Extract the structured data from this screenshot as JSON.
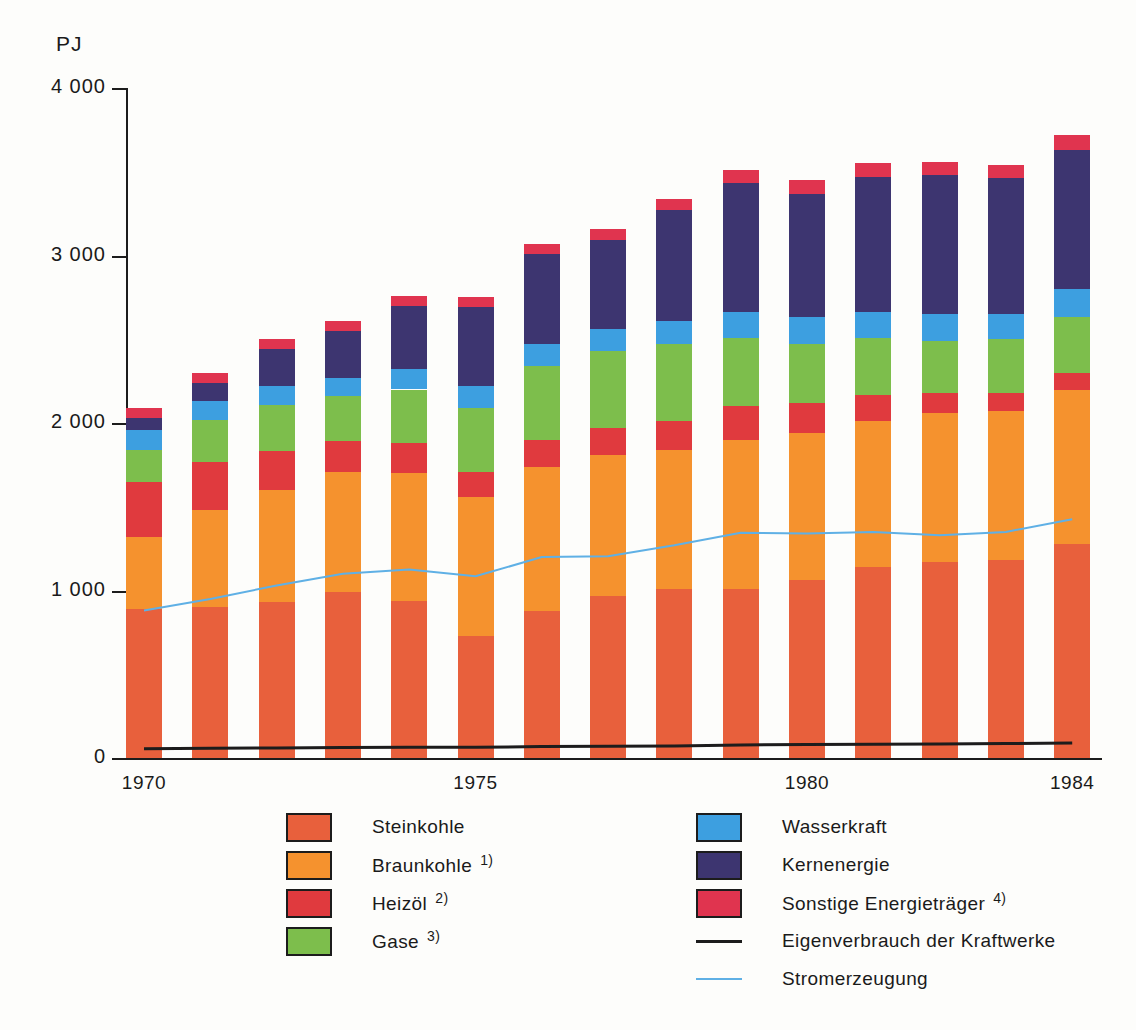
{
  "chart_data": {
    "type": "bar",
    "stacked": true,
    "title": "",
    "subtitle": "",
    "xlabel": "",
    "ylabel": "PJ",
    "unit": "PJ",
    "ylim": [
      0,
      4000
    ],
    "yticks": [
      "0",
      "1 000",
      "2 000",
      "3 000",
      "4 000"
    ],
    "ytick_values": [
      0,
      1000,
      2000,
      3000,
      4000
    ],
    "xticks_shown": [
      "1970",
      "1975",
      "1980",
      "1984"
    ],
    "grid": false,
    "legend_position": "below",
    "categories": [
      "1970",
      "1971",
      "1972",
      "1973",
      "1974",
      "1975",
      "1976",
      "1977",
      "1978",
      "1979",
      "1980",
      "1981",
      "1982",
      "1983",
      "1984"
    ],
    "series": [
      {
        "name": "Steinkohle",
        "color": "#e8603c",
        "values": [
          890,
          900,
          930,
          990,
          940,
          730,
          880,
          970,
          1010,
          1010,
          1060,
          1140,
          1170,
          1180,
          1280
        ]
      },
      {
        "name": "Braunkohle",
        "footnote": "1)",
        "color": "#f5922e",
        "values": [
          430,
          580,
          670,
          720,
          760,
          830,
          860,
          840,
          830,
          890,
          880,
          870,
          890,
          890,
          920
        ]
      },
      {
        "name": "Heizöl",
        "footnote": "2)",
        "color": "#e03a3e",
        "values": [
          330,
          290,
          230,
          180,
          180,
          150,
          160,
          160,
          170,
          200,
          180,
          160,
          120,
          110,
          100
        ]
      },
      {
        "name": "Gase",
        "footnote": "3)",
        "color": "#7dbe4c",
        "values": [
          190,
          250,
          280,
          270,
          320,
          380,
          440,
          460,
          460,
          410,
          350,
          340,
          310,
          320,
          330
        ]
      },
      {
        "name": "Wasserkraft",
        "color": "#3d9fe0",
        "values": [
          120,
          110,
          110,
          110,
          120,
          130,
          130,
          130,
          140,
          150,
          160,
          150,
          160,
          150,
          170
        ]
      },
      {
        "name": "Kernenergie",
        "color": "#3d3570",
        "values": [
          70,
          110,
          220,
          280,
          380,
          470,
          540,
          530,
          660,
          770,
          740,
          810,
          830,
          810,
          830
        ]
      },
      {
        "name": "Sonstige Energieträger",
        "footnote": "4)",
        "color": "#e0344f",
        "values": [
          60,
          60,
          60,
          60,
          60,
          60,
          60,
          70,
          70,
          80,
          80,
          80,
          80,
          80,
          90
        ]
      }
    ],
    "lines": [
      {
        "name": "Eigenverbrauch der Kraftwerke",
        "color": "#1c1c1c",
        "style": "solid",
        "width": 3,
        "values": [
          55,
          58,
          60,
          62,
          64,
          64,
          68,
          70,
          72,
          78,
          80,
          82,
          84,
          86,
          90
        ]
      },
      {
        "name": "Stromerzeugung",
        "color": "#5fb0e5",
        "style": "solid",
        "width": 2,
        "values": [
          880,
          950,
          1030,
          1100,
          1125,
          1085,
          1200,
          1205,
          1270,
          1345,
          1340,
          1350,
          1330,
          1350,
          1425
        ]
      }
    ],
    "totals": [
      2410,
      2530,
      2690,
      2900,
      3000,
      2900,
      3160,
      3160,
      3320,
      3500,
      3490,
      3470,
      3450,
      3500,
      3760
    ]
  },
  "axes": {
    "unit_label": "PJ",
    "y_tick_labels": [
      "4 000",
      "3 000",
      "2 000",
      "1 000",
      "0"
    ],
    "x_tick_labels": [
      "1970",
      "1975",
      "1980",
      "1984"
    ]
  },
  "legend": {
    "left_items": [
      {
        "label": "Steinkohle",
        "footnote": "",
        "color": "#e8603c",
        "marker": "swatch"
      },
      {
        "label": "Braunkohle",
        "footnote": "1)",
        "color": "#f5922e",
        "marker": "swatch"
      },
      {
        "label": "Heizöl",
        "footnote": "2)",
        "color": "#e03a3e",
        "marker": "swatch"
      },
      {
        "label": "Gase",
        "footnote": "3)",
        "color": "#7dbe4c",
        "marker": "swatch"
      }
    ],
    "right_items": [
      {
        "label": "Wasserkraft",
        "footnote": "",
        "color": "#3d9fe0",
        "marker": "swatch"
      },
      {
        "label": "Kernenergie",
        "footnote": "",
        "color": "#3d3570",
        "marker": "swatch"
      },
      {
        "label": "Sonstige Energieträger",
        "footnote": "4)",
        "color": "#e0344f",
        "marker": "swatch"
      },
      {
        "label": "Eigenverbrauch der Kraftwerke",
        "footnote": "",
        "color": "#1c1c1c",
        "marker": "line"
      },
      {
        "label": "Stromerzeugung",
        "footnote": "",
        "color": "#5fb0e5",
        "marker": "line-blue"
      }
    ]
  }
}
